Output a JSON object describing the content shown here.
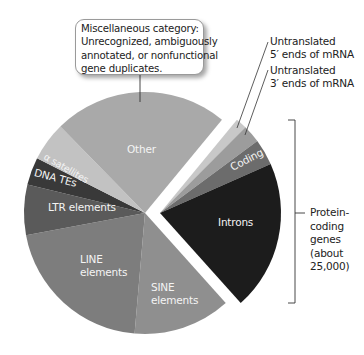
{
  "callout": {
    "lines": [
      "Miscellaneous category:",
      "Unrecognized, ambiguously",
      "annotated, or nonfunctional",
      "gene duplicates."
    ]
  },
  "annotations": {
    "utr5": [
      "Untranslated",
      "5′ ends of mRNA"
    ],
    "utr3": [
      "Untranslated",
      "3′ ends of mRNA"
    ],
    "bracket": [
      "Protein-",
      "coding",
      "genes",
      "(about",
      "25,000)"
    ]
  },
  "slice_labels": {
    "other": "Other",
    "alpha_satellites": "α satellites",
    "dna_tes": "DNA TEs",
    "ltr": "LTR elements",
    "line": [
      "LINE",
      "elements"
    ],
    "sine": [
      "SINE",
      "elements"
    ],
    "introns": "Introns",
    "coding": "Coding"
  },
  "chart_data": {
    "type": "pie",
    "title": "",
    "exploded_group": "Protein-coding genes (about 25,000)",
    "start_angle_deg": 39.5,
    "direction": "clockwise",
    "slices": [
      {
        "label": "Untranslated 5′ ends of mRNA",
        "value": 1.5,
        "color": "#c8c8c8",
        "group": "protein-coding"
      },
      {
        "label": "Untranslated 3′ ends of mRNA",
        "value": 2.4,
        "color": "#9c9c9c",
        "group": "protein-coding"
      },
      {
        "label": "Coding",
        "value": 3.5,
        "color": "#6c6c6c",
        "group": "protein-coding"
      },
      {
        "label": "Introns",
        "value": 20.0,
        "color": "#1c1c1c",
        "group": "protein-coding"
      },
      {
        "label": "SINE elements",
        "value": 13.0,
        "color": "#8f8f8f"
      },
      {
        "label": "LINE elements",
        "value": 20.7,
        "color": "#7d7d7d"
      },
      {
        "label": "LTR elements",
        "value": 6.7,
        "color": "#5a5a5a"
      },
      {
        "label": "DNA TEs",
        "value": 3.7,
        "color": "#393939"
      },
      {
        "label": "α satellites",
        "value": 5.2,
        "color": "#c2c2c2"
      },
      {
        "label": "Other",
        "value": 23.3,
        "color": "#a9a9a9"
      }
    ],
    "units": "approximate % of genome (estimated from angles)"
  }
}
